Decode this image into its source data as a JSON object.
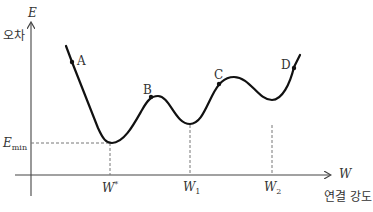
{
  "axes": {
    "y_label": "E",
    "y_caption": "오차",
    "x_label": "W",
    "x_caption": "연결 강도"
  },
  "markers": {
    "e_min": {
      "base": "E",
      "sub": "min"
    },
    "w_star": {
      "base": "W",
      "sup": "*"
    },
    "w1": {
      "base": "W",
      "sub": "1"
    },
    "w2": {
      "base": "W",
      "sub": "2"
    }
  },
  "points": {
    "A": "A",
    "B": "B",
    "C": "C",
    "D": "D"
  },
  "colors": {
    "curve": "#111111",
    "axis": "#444444",
    "dashed": "#777777",
    "text": "#333333"
  }
}
